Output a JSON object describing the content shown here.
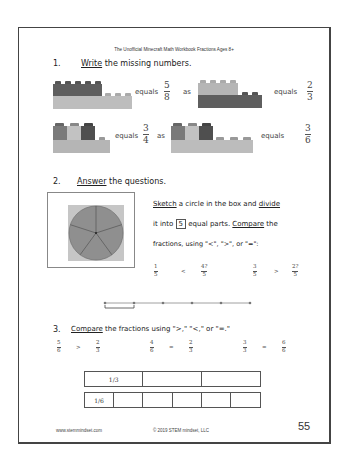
{
  "header": {
    "title": "The Unofficial Minecraft Math Workbook Fractions Ages 8+"
  },
  "q1": {
    "number": "1.",
    "verb": "Write",
    "rest": " the missing numbers.",
    "rows": [
      {
        "left": {
          "word": "equals",
          "num": "5",
          "den": "8"
        },
        "as": "as",
        "right": {
          "word": "equals",
          "num": "2",
          "den": "3"
        }
      },
      {
        "left": {
          "word": "equals",
          "num": "3",
          "den": "4"
        },
        "as": "as",
        "right": {
          "word": "equals",
          "num": "3",
          "den": "6"
        }
      }
    ]
  },
  "q2": {
    "number": "2.",
    "verb": "Answer",
    "rest": " the questions.",
    "line1_a": "Sketch",
    "line1_b": " a circle in the box and ",
    "line1_c": "divide",
    "line2_a": "it into ",
    "line2_box": "5",
    "line2_b": " equal parts. ",
    "line2_c": "Compare",
    "line2_d": " the",
    "line3": "fractions, using \"<\", \">\", or \"=\":",
    "comparisons": [
      {
        "a_num": "1",
        "a_den": "5",
        "op": "<",
        "b_num": "4",
        "b_den": "5",
        "b_suffix": "?"
      },
      {
        "a_num": "3",
        "a_den": "5",
        "op": ">",
        "b_num": "2",
        "b_den": "5",
        "b_suffix": "?"
      }
    ],
    "pie_slices": 5
  },
  "q3": {
    "number": "3.",
    "verb": "Compare",
    "rest": " the fractions using \">,\" \"<,\" or \"=.\"",
    "comparisons": [
      {
        "a_num": "5",
        "a_den": "6",
        "op": ">",
        "b_num": "2",
        "b_den": "3"
      },
      {
        "a_num": "4",
        "a_den": "6",
        "op": "=",
        "b_num": "2",
        "b_den": "3"
      },
      {
        "a_num": "3",
        "a_den": "3",
        "op": "=",
        "b_num": "6",
        "b_den": "6"
      }
    ],
    "strip_thirds": {
      "label": "1/3",
      "cells": 3
    },
    "strip_sixths": {
      "label": "1/6",
      "cells": 6
    }
  },
  "footer": {
    "website": "www.stemmindset.com",
    "copyright": "© 2019 STEM mindset, LLC",
    "page_number": "55"
  },
  "colors": {
    "brick_dark": "#5a5a5a",
    "brick_light": "#b8b8b8",
    "brick_mid": "#8a8a8a",
    "pie": "#8f8f8f",
    "pie_bg": "#c4c4c4"
  }
}
